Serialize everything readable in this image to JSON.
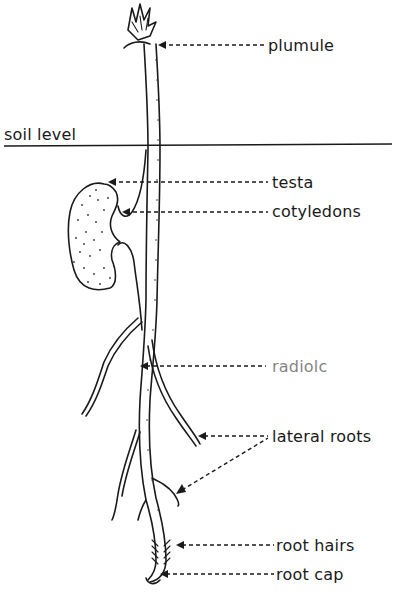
{
  "diagram": {
    "soil_level_label": "soil level",
    "labels": [
      {
        "id": "plumule",
        "text": "plumule"
      },
      {
        "id": "testa",
        "text": "testa"
      },
      {
        "id": "cotyledons",
        "text": "cotyledons"
      },
      {
        "id": "radicle",
        "text": "radiolc"
      },
      {
        "id": "lateral_roots",
        "text": "lateral roots"
      },
      {
        "id": "root_hairs",
        "text": "root hairs"
      },
      {
        "id": "root_cap",
        "text": "root cap"
      }
    ],
    "colors": {
      "ink": "#1a1a1a",
      "background": "#ffffff"
    }
  }
}
